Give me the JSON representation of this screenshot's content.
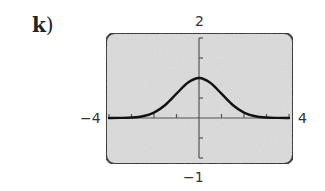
{
  "problem": {
    "letter": "k",
    "paren": ")"
  },
  "window": {
    "xmin_label": "−4",
    "xmax_label": "4",
    "ymin_label": "−1",
    "ymax_label": "2"
  },
  "colors": {
    "screen_bg": "#dcdcdc",
    "frame": "#222222",
    "axes": "#555555",
    "curve": "#111111"
  },
  "chart_data": {
    "type": "line",
    "title": "",
    "xlabel": "",
    "ylabel": "",
    "xlim": [
      -4,
      4
    ],
    "ylim": [
      -1,
      2
    ],
    "x_tick_step": 1,
    "y_tick_step": 0.5,
    "grid": false,
    "legend": null,
    "tick_labels": {
      "x_left": "−4",
      "x_right": "4",
      "y_top": "2",
      "y_bottom": "−1"
    },
    "series": [
      {
        "name": "y ≈ e^(−x²/2)",
        "x": [
          -4,
          -3.5,
          -3,
          -2.5,
          -2,
          -1.5,
          -1,
          -0.5,
          0,
          0.5,
          1,
          1.5,
          2,
          2.5,
          3,
          3.5,
          4
        ],
        "y": [
          0.0003,
          0.0022,
          0.011,
          0.044,
          0.135,
          0.325,
          0.607,
          0.882,
          1.0,
          0.882,
          0.607,
          0.325,
          0.135,
          0.044,
          0.011,
          0.0022,
          0.0003
        ]
      }
    ]
  }
}
